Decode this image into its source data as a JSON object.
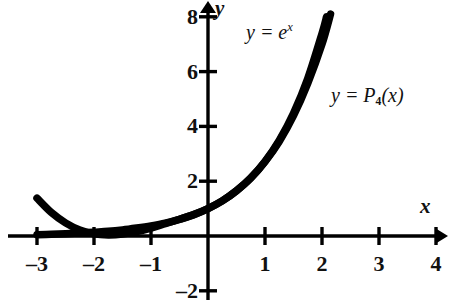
{
  "chart_data": {
    "type": "line",
    "title": "",
    "subtitle": "",
    "xlabel": "x",
    "ylabel": "y",
    "xlim": [
      -3.5,
      4.3
    ],
    "ylim": [
      -2.4,
      8.6
    ],
    "xticks": [
      -3,
      -2,
      -1,
      1,
      2,
      3,
      4
    ],
    "yticks": [
      8,
      6,
      4,
      2,
      -2
    ],
    "xtick_labels": [
      "–3",
      "–2",
      "–1",
      "1",
      "2",
      "3",
      "4"
    ],
    "ytick_labels": [
      "8",
      "6",
      "4",
      "2",
      "–2"
    ],
    "grid": false,
    "legend_position": "inline-annotations",
    "axis_style": "arrowed-cartesian-cross",
    "series": [
      {
        "name": "y = e^x",
        "label_text": "y = e",
        "label_sup": "x",
        "color": "#000000",
        "x": [
          -3.0,
          -2.75,
          -2.5,
          -2.25,
          -2.0,
          -1.75,
          -1.5,
          -1.25,
          -1.0,
          -0.75,
          -0.5,
          -0.25,
          0.0,
          0.25,
          0.5,
          0.75,
          1.0,
          1.25,
          1.5,
          1.75,
          2.0,
          2.08
        ],
        "y": [
          0.05,
          0.06,
          0.08,
          0.11,
          0.14,
          0.17,
          0.22,
          0.29,
          0.37,
          0.47,
          0.61,
          0.78,
          1.0,
          1.28,
          1.65,
          2.12,
          2.72,
          3.49,
          4.48,
          5.75,
          7.39,
          8.0
        ]
      },
      {
        "name": "y = P4(x)",
        "label_text": "y = P",
        "label_sub": "4",
        "label_tail": "(x)",
        "color": "#000000",
        "x": [
          -3.0,
          -2.75,
          -2.5,
          -2.25,
          -2.0,
          -1.75,
          -1.5,
          -1.25,
          -1.0,
          -0.75,
          -0.5,
          -0.25,
          0.0,
          0.25,
          0.5,
          0.75,
          1.0,
          1.25,
          1.5,
          1.75,
          2.0,
          2.15
        ],
        "y": [
          1.38,
          0.86,
          0.48,
          0.22,
          0.08,
          0.04,
          0.07,
          0.16,
          0.29,
          0.45,
          0.61,
          0.78,
          1.0,
          1.28,
          1.65,
          2.11,
          2.71,
          3.45,
          4.39,
          5.57,
          7.0,
          8.1
        ]
      }
    ],
    "annotations": [
      {
        "id": "ann-exp",
        "text": "y = e^x",
        "x_px": 248,
        "y_px": 26
      },
      {
        "id": "ann-p4",
        "text": "y = P_4(x)",
        "x_px": 333,
        "y_px": 89
      }
    ]
  },
  "axes": {
    "x_axis_name": "x",
    "y_axis_name": "y",
    "origin_px": {
      "x": 208,
      "y": 236
    },
    "unit_px": {
      "x": 57.0,
      "y": 27.4
    }
  },
  "labels": {
    "x_axis_label": "x",
    "y_axis_label": "y",
    "exp_prefix": "y = e",
    "exp_superscript": "x",
    "poly_prefix": "y = P",
    "poly_subscript": "4",
    "poly_suffix": "(x)"
  },
  "ticks": {
    "x": [
      {
        "value": -3,
        "text": "–3"
      },
      {
        "value": -2,
        "text": "–2"
      },
      {
        "value": -1,
        "text": "–1"
      },
      {
        "value": 1,
        "text": "1"
      },
      {
        "value": 2,
        "text": "2"
      },
      {
        "value": 3,
        "text": "3"
      },
      {
        "value": 4,
        "text": "4"
      }
    ],
    "y": [
      {
        "value": 8,
        "text": "8"
      },
      {
        "value": 6,
        "text": "6"
      },
      {
        "value": 4,
        "text": "4"
      },
      {
        "value": 2,
        "text": "2"
      },
      {
        "value": -2,
        "text": "–2"
      }
    ]
  },
  "style": {
    "ink": "#111111",
    "curve_color": "#000000",
    "background": "#ffffff"
  }
}
